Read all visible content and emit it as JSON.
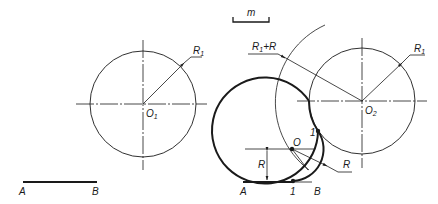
{
  "scale_marker": {
    "label": "m"
  },
  "left_figure": {
    "circle_center_label": "O",
    "circle_center_sub": "1",
    "radius_label": "R",
    "radius_sub": "1",
    "segment_start_label": "A",
    "segment_end_label": "B"
  },
  "right_figure": {
    "circle_center_label": "O",
    "circle_center_sub": "2",
    "radius_label": "R",
    "radius_sub": "1",
    "big_arc_label_R1": "R",
    "big_arc_label_sub": "1",
    "big_arc_label_rest": "+R",
    "arc_center_label": "O",
    "fillet_radius_label": "R",
    "offset_label": "R",
    "tangent_point_circle_label": "1",
    "tangent_point_line_label": "1",
    "segment_start_label": "A",
    "segment_end_label": "B"
  },
  "colors": {
    "line": "#1a1a1a",
    "background": "#ffffff"
  }
}
